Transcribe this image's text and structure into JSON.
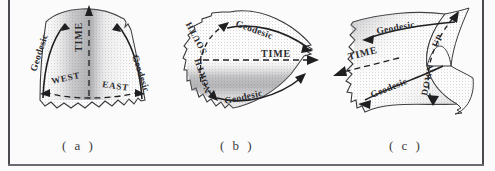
{
  "figure": {
    "background_color": "#fbfbfb",
    "ink_color": "#2b2b2e",
    "frame": {
      "left_rule": true,
      "right_rule": true,
      "bottom_rule": true,
      "top_rule": false,
      "rule_color": "#4a4a4f"
    },
    "panels": [
      {
        "id": "a",
        "caption": "( a )",
        "surface": "positively-curved-patch",
        "labels": {
          "time_axis": "TIME",
          "time_direction": "up",
          "left_geodesic": "Geodesic",
          "right_geodesic": "Geodesic",
          "left_direction": "WEST",
          "right_direction": "EAST"
        }
      },
      {
        "id": "b",
        "caption": "( b )",
        "surface": "cone-like-patch",
        "labels": {
          "time_axis": "TIME",
          "time_direction": "right",
          "upper_geodesic": "Geodesic",
          "lower_geodesic": "Geodesic",
          "upper_direction": "SOUTH",
          "lower_direction": "NORTH"
        }
      },
      {
        "id": "c",
        "caption": "( c )",
        "surface": "saddle-hyperbolic-patch",
        "labels": {
          "time_axis": "TIME",
          "time_direction": "down-left",
          "upper_geodesic": "Geodesic",
          "lower_geodesic": "Geodesic",
          "upper_direction": "UP",
          "lower_direction": "DOWN"
        }
      }
    ]
  }
}
